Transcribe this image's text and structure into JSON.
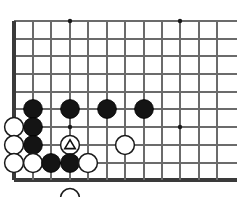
{
  "figure": {
    "kind": "go-board-diagram",
    "width": 237,
    "height": 197,
    "background_color": "#ffffff"
  },
  "board": {
    "line_color": "#6b6b6b",
    "edge_color": "#3a3a3a",
    "line_width": 1.1,
    "edge_width": 3.2,
    "column_x": [
      14,
      33,
      51,
      70,
      88,
      107,
      125,
      144,
      162,
      180,
      199,
      217
    ],
    "row_y": [
      21,
      39,
      56,
      74,
      92,
      109,
      127,
      145,
      163,
      180
    ],
    "left_edge_col": 0,
    "bottom_edge_row": 9,
    "line_overrun_right": 237,
    "star_points": [
      {
        "col": 3,
        "row": 0
      },
      {
        "col": 9,
        "row": 0
      },
      {
        "col": 3,
        "row": 6
      },
      {
        "col": 9,
        "row": 6
      }
    ],
    "star_radius": 2.2
  },
  "stones": {
    "radius": 9.4,
    "black_fill": "#141414",
    "white_fill": "#ffffff",
    "white_stroke": "#1a1a1a",
    "items": [
      {
        "name": "black-stone-c1-r5",
        "color": "black",
        "col": 1,
        "row": 5,
        "marker": null
      },
      {
        "name": "black-stone-c3-r5",
        "color": "black",
        "col": 3,
        "row": 5,
        "marker": null
      },
      {
        "name": "black-stone-c5-r5",
        "color": "black",
        "col": 5,
        "row": 5,
        "marker": null
      },
      {
        "name": "black-stone-c7-r5",
        "color": "black",
        "col": 7,
        "row": 5,
        "marker": null
      },
      {
        "name": "white-stone-c0-r6",
        "color": "white",
        "col": 0,
        "row": 6,
        "marker": null
      },
      {
        "name": "black-stone-c1-r6",
        "color": "black",
        "col": 1,
        "row": 6,
        "marker": null
      },
      {
        "name": "white-stone-c0-r7",
        "color": "white",
        "col": 0,
        "row": 7,
        "marker": null
      },
      {
        "name": "black-stone-c1-r7",
        "color": "black",
        "col": 1,
        "row": 7,
        "marker": null
      },
      {
        "name": "white-stone-marked-c3-r7",
        "color": "white",
        "col": 3,
        "row": 7,
        "marker": "triangle"
      },
      {
        "name": "white-stone-c6-r7",
        "color": "white",
        "col": 6,
        "row": 7,
        "marker": null
      },
      {
        "name": "white-stone-c0-r8",
        "color": "white",
        "col": 0,
        "row": 8,
        "marker": null
      },
      {
        "name": "white-stone-c1-r8",
        "color": "white",
        "col": 1,
        "row": 8,
        "marker": null
      },
      {
        "name": "black-stone-c2-r8",
        "color": "black",
        "col": 2,
        "row": 8,
        "marker": null
      },
      {
        "name": "black-stone-c3-r8",
        "color": "black",
        "col": 3,
        "row": 8,
        "marker": null
      },
      {
        "name": "white-stone-c4-r8",
        "color": "white",
        "col": 4,
        "row": 8,
        "marker": null
      },
      {
        "name": "white-stone-captured-below-edge",
        "color": "white",
        "col": 3,
        "row": 9,
        "row_offset": 18,
        "marker": null
      }
    ]
  },
  "marker": {
    "type": "triangle",
    "stroke_color": "#101010",
    "size": 10.5
  }
}
